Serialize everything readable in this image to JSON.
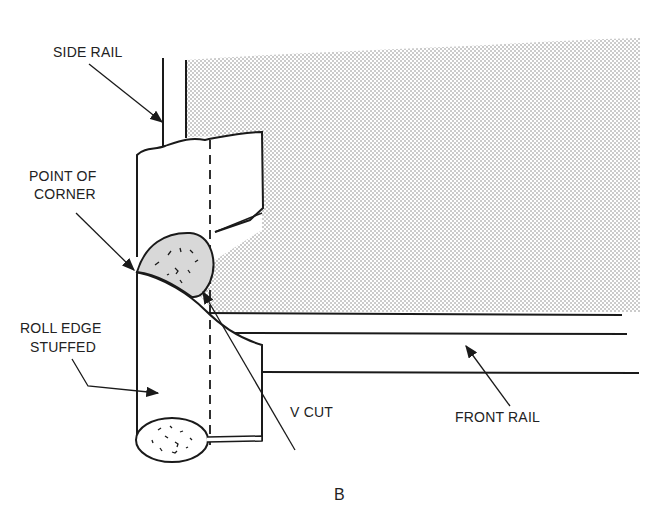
{
  "labels": {
    "side_rail": "SIDE RAIL",
    "point_of_corner_1": "POINT OF",
    "point_of_corner_2": "CORNER",
    "roll_edge_1": "ROLL EDGE",
    "roll_edge_2": "STUFFED",
    "v_cut": "V CUT",
    "front_rail": "FRONT RAIL",
    "figure_letter": "B"
  },
  "colors": {
    "line": "#1a1a1a",
    "stipple": "#9a9a9a",
    "stuffing_fill": "#d8d8d8"
  }
}
